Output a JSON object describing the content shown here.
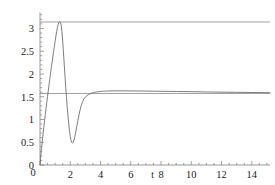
{
  "chart_data": {
    "type": "line",
    "title": "",
    "xlabel": "t",
    "ylabel": "",
    "xlim": [
      0,
      15.2
    ],
    "ylim": [
      0,
      3.35
    ],
    "grid": false,
    "legend": null,
    "x_ticks": [
      0,
      2,
      4,
      6,
      8,
      10,
      12,
      14
    ],
    "x_tick_labels": [
      "0",
      "2",
      "4",
      "6",
      "8",
      "10",
      "12",
      "14"
    ],
    "x_minor_step": 0.5,
    "y_ticks": [
      0,
      0.5,
      1,
      1.5,
      2,
      2.5,
      3
    ],
    "y_tick_labels": [
      "0",
      "0.5",
      "1",
      "1.5",
      "2",
      "2.5",
      "3"
    ],
    "y_minor_step": 0.1,
    "series": [
      {
        "name": "transient-response",
        "color": "#6e6e6e",
        "points": [
          [
            0.0,
            0.0
          ],
          [
            0.02,
            0.06
          ],
          [
            0.05,
            0.18
          ],
          [
            0.1,
            0.36
          ],
          [
            0.15,
            0.52
          ],
          [
            0.2,
            0.68
          ],
          [
            0.25,
            0.83
          ],
          [
            0.3,
            0.97
          ],
          [
            0.35,
            1.11
          ],
          [
            0.4,
            1.25
          ],
          [
            0.45,
            1.38
          ],
          [
            0.5,
            1.51
          ],
          [
            0.55,
            1.64
          ],
          [
            0.6,
            1.77
          ],
          [
            0.65,
            1.9
          ],
          [
            0.7,
            2.02
          ],
          [
            0.75,
            2.14
          ],
          [
            0.8,
            2.26
          ],
          [
            0.85,
            2.38
          ],
          [
            0.9,
            2.5
          ],
          [
            0.95,
            2.61
          ],
          [
            1.0,
            2.72
          ],
          [
            1.05,
            2.83
          ],
          [
            1.1,
            2.93
          ],
          [
            1.15,
            3.02
          ],
          [
            1.2,
            3.09
          ],
          [
            1.25,
            3.13
          ],
          [
            1.3,
            3.15
          ],
          [
            1.35,
            3.14
          ],
          [
            1.4,
            3.07
          ],
          [
            1.45,
            2.93
          ],
          [
            1.5,
            2.72
          ],
          [
            1.55,
            2.48
          ],
          [
            1.6,
            2.22
          ],
          [
            1.65,
            1.96
          ],
          [
            1.7,
            1.71
          ],
          [
            1.75,
            1.48
          ],
          [
            1.8,
            1.26
          ],
          [
            1.85,
            1.07
          ],
          [
            1.9,
            0.9
          ],
          [
            1.95,
            0.75
          ],
          [
            2.0,
            0.63
          ],
          [
            2.05,
            0.54
          ],
          [
            2.1,
            0.49
          ],
          [
            2.15,
            0.48
          ],
          [
            2.2,
            0.5
          ],
          [
            2.25,
            0.55
          ],
          [
            2.3,
            0.62
          ],
          [
            2.35,
            0.7
          ],
          [
            2.4,
            0.79
          ],
          [
            2.5,
            0.97
          ],
          [
            2.6,
            1.14
          ],
          [
            2.7,
            1.28
          ],
          [
            2.8,
            1.38
          ],
          [
            2.9,
            1.45
          ],
          [
            3.0,
            1.49
          ],
          [
            3.1,
            1.52
          ],
          [
            3.2,
            1.545
          ],
          [
            3.3,
            1.56
          ],
          [
            3.4,
            1.575
          ],
          [
            3.5,
            1.585
          ],
          [
            3.6,
            1.595
          ],
          [
            3.7,
            1.602
          ],
          [
            3.8,
            1.608
          ],
          [
            3.9,
            1.613
          ],
          [
            4.0,
            1.617
          ],
          [
            4.2,
            1.622
          ],
          [
            4.4,
            1.625
          ],
          [
            4.6,
            1.627
          ],
          [
            5.0,
            1.628
          ],
          [
            5.5,
            1.628
          ],
          [
            6.0,
            1.627
          ],
          [
            7.0,
            1.624
          ],
          [
            8.0,
            1.62
          ],
          [
            9.0,
            1.615
          ],
          [
            10.0,
            1.61
          ],
          [
            11.0,
            1.605
          ],
          [
            12.0,
            1.6
          ],
          [
            13.0,
            1.596
          ],
          [
            14.0,
            1.592
          ],
          [
            15.0,
            1.589
          ],
          [
            15.2,
            1.588
          ]
        ]
      }
    ],
    "reference_lines": [
      {
        "name": "upper-asymptote-pi",
        "orientation": "horizontal",
        "value": 3.14159,
        "color": "#8a8a8a"
      },
      {
        "name": "lower-asymptote-half-pi",
        "orientation": "horizontal",
        "value": 1.5708,
        "color": "#8a8a8a"
      }
    ],
    "axis_color": "#8a8a8a"
  }
}
